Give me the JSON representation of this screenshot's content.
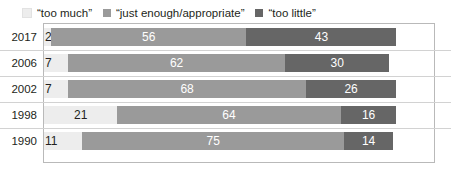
{
  "chart_data": {
    "type": "bar",
    "subtype": "stacked-horizontal-100pct",
    "title": "",
    "xlabel": "",
    "ylabel": "",
    "orientation": "horizontal",
    "stacked": true,
    "grid": false,
    "legend_position": "top-left",
    "categories": [
      "2017",
      "2006",
      "2002",
      "1998",
      "1990"
    ],
    "series": [
      {
        "name": "“too much”",
        "color": "#ededed",
        "values": [
          2,
          7,
          7,
          21,
          11
        ]
      },
      {
        "name": "“just enough/appropriate”",
        "color": "#9a9a9a",
        "values": [
          56,
          62,
          68,
          64,
          75
        ]
      },
      {
        "name": "“too little”",
        "color": "#666666",
        "values": [
          43,
          30,
          26,
          16,
          14
        ]
      }
    ],
    "rows": [
      {
        "category": "2017",
        "segments": [
          {
            "series": "“too much”",
            "value": 2,
            "label": "2",
            "color": "#ededed",
            "label_color": "#231f20"
          },
          {
            "series": "“just enough/appropriate”",
            "value": 56,
            "label": "56",
            "color": "#9a9a9a",
            "label_color": "#ffffff"
          },
          {
            "series": "“too little”",
            "value": 43,
            "label": "43",
            "color": "#666666",
            "label_color": "#ffffff"
          }
        ]
      },
      {
        "category": "2006",
        "segments": [
          {
            "series": "“too much”",
            "value": 7,
            "label": "7",
            "color": "#ededed",
            "label_color": "#231f20"
          },
          {
            "series": "“just enough/appropriate”",
            "value": 62,
            "label": "62",
            "color": "#9a9a9a",
            "label_color": "#ffffff"
          },
          {
            "series": "“too little”",
            "value": 30,
            "label": "30",
            "color": "#666666",
            "label_color": "#ffffff"
          }
        ]
      },
      {
        "category": "2002",
        "segments": [
          {
            "series": "“too much”",
            "value": 7,
            "label": "7",
            "color": "#ededed",
            "label_color": "#231f20"
          },
          {
            "series": "“just enough/appropriate”",
            "value": 68,
            "label": "68",
            "color": "#9a9a9a",
            "label_color": "#ffffff"
          },
          {
            "series": "“too little”",
            "value": 26,
            "label": "26",
            "color": "#666666",
            "label_color": "#ffffff"
          }
        ]
      },
      {
        "category": "1998",
        "segments": [
          {
            "series": "“too much”",
            "value": 21,
            "label": "21",
            "color": "#ededed",
            "label_color": "#231f20"
          },
          {
            "series": "“just enough/appropriate”",
            "value": 64,
            "label": "64",
            "color": "#9a9a9a",
            "label_color": "#ffffff"
          },
          {
            "series": "“too little”",
            "value": 16,
            "label": "16",
            "color": "#666666",
            "label_color": "#ffffff"
          }
        ]
      },
      {
        "category": "1990",
        "segments": [
          {
            "series": "“too much”",
            "value": 11,
            "label": "11",
            "color": "#ededed",
            "label_color": "#231f20"
          },
          {
            "series": "“just enough/appropriate”",
            "value": 75,
            "label": "75",
            "color": "#9a9a9a",
            "label_color": "#ffffff"
          },
          {
            "series": "“too little”",
            "value": 14,
            "label": "14",
            "color": "#666666",
            "label_color": "#ffffff"
          }
        ]
      }
    ]
  },
  "legend": {
    "items": [
      {
        "label": "“too much”",
        "color": "#ededed"
      },
      {
        "label": "“just enough/appropriate”",
        "color": "#9a9a9a"
      },
      {
        "label": "“too little”",
        "color": "#666666"
      }
    ]
  },
  "style": {
    "plot_border_color": "#b9b9b9",
    "row_separator_color": "#d2d2d2",
    "background": "#ffffff",
    "text_color": "#231f20"
  },
  "layout": {
    "plot_left": 43,
    "plot_top": 23,
    "plot_width": 392,
    "plot_height": 140,
    "bar_left": 44,
    "row_height": 26,
    "bar_height": 18,
    "px_per_unit": 3.49
  }
}
